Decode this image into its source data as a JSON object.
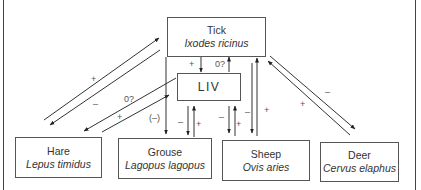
{
  "nodes": {
    "tick": {
      "common": "Tick",
      "latin": "Ixodes ricinus"
    },
    "liv": {
      "common": "LIV",
      "latin": ""
    },
    "hare": {
      "common": "Hare",
      "latin": "Lepus timidus"
    },
    "grouse": {
      "common": "Grouse",
      "latin": "Lagopus lagopus"
    },
    "sheep": {
      "common": "Sheep",
      "latin": "Ovis aries"
    },
    "deer": {
      "common": "Deer",
      "latin": "Cervus elaphus"
    }
  },
  "edges": [
    {
      "id": "hare-to-tick",
      "from": "hare",
      "to": "tick",
      "label": "+"
    },
    {
      "id": "tick-to-hare",
      "from": "tick",
      "to": "hare",
      "label": "–"
    },
    {
      "id": "liv-to-hare",
      "from": "liv",
      "to": "hare",
      "label": "0?"
    },
    {
      "id": "hare-to-liv",
      "from": "hare",
      "to": "liv",
      "label": "+"
    },
    {
      "id": "tick-to-liv",
      "from": "tick",
      "to": "liv",
      "label": "+"
    },
    {
      "id": "liv-to-tick",
      "from": "liv",
      "to": "tick",
      "label": "0?"
    },
    {
      "id": "tick-to-grouse",
      "from": "tick",
      "to": "grouse",
      "label": "(–)"
    },
    {
      "id": "liv-to-grouse",
      "from": "liv",
      "to": "grouse",
      "label": "–"
    },
    {
      "id": "grouse-to-liv",
      "from": "grouse",
      "to": "liv",
      "label": "+"
    },
    {
      "id": "liv-to-sheep",
      "from": "liv",
      "to": "sheep",
      "label": "–"
    },
    {
      "id": "sheep-to-liv",
      "from": "sheep",
      "to": "liv",
      "label": "+"
    },
    {
      "id": "tick-to-sheep",
      "from": "tick",
      "to": "sheep",
      "label": "–"
    },
    {
      "id": "sheep-to-tick",
      "from": "sheep",
      "to": "tick",
      "label": "+"
    },
    {
      "id": "tick-to-deer",
      "from": "tick",
      "to": "deer",
      "label": "–"
    },
    {
      "id": "deer-to-tick",
      "from": "deer",
      "to": "tick",
      "label": "+"
    }
  ],
  "colors": {
    "line": "#333333",
    "box_border": "#555555",
    "text": "#333333"
  }
}
